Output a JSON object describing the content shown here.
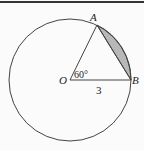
{
  "diagram": {
    "points": {
      "O": {
        "label": "O",
        "x": 70,
        "y": 80
      },
      "A": {
        "label": "A",
        "x": 97,
        "y": 25
      },
      "B": {
        "label": "B",
        "x": 131,
        "y": 80
      }
    },
    "angle_label": "60°",
    "radius_label": "3",
    "colors": {
      "stroke": "#444444",
      "shade": "#b8b8b8",
      "top_rule": "#333333",
      "background": "#fbfbfb"
    }
  }
}
